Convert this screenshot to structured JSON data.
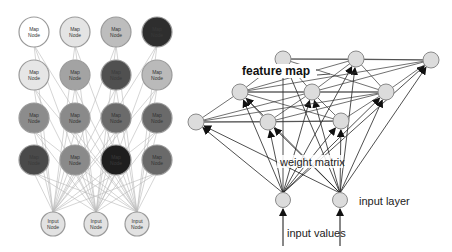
{
  "left_diagram": {
    "map_node_label_line1": "Map",
    "map_node_label_line2": "Node",
    "input_node_label_line1": "Input",
    "input_node_label_line2": "Node",
    "map_nodes": [
      {
        "row": 0,
        "col": 0,
        "fill": "#ffffff"
      },
      {
        "row": 0,
        "col": 1,
        "fill": "#e4e4e4"
      },
      {
        "row": 0,
        "col": 2,
        "fill": "#bdbdbd"
      },
      {
        "row": 0,
        "col": 3,
        "fill": "#2e2e2e"
      },
      {
        "row": 1,
        "col": 0,
        "fill": "#e6e6e6"
      },
      {
        "row": 1,
        "col": 1,
        "fill": "#a3a3a3"
      },
      {
        "row": 1,
        "col": 2,
        "fill": "#505050"
      },
      {
        "row": 1,
        "col": 3,
        "fill": "#bababa"
      },
      {
        "row": 2,
        "col": 0,
        "fill": "#8c8c8c"
      },
      {
        "row": 2,
        "col": 1,
        "fill": "#8a8a8a"
      },
      {
        "row": 2,
        "col": 2,
        "fill": "#6b6b6b"
      },
      {
        "row": 2,
        "col": 3,
        "fill": "#6a6a6a"
      },
      {
        "row": 3,
        "col": 0,
        "fill": "#4a4a4a"
      },
      {
        "row": 3,
        "col": 1,
        "fill": "#8a8a8a"
      },
      {
        "row": 3,
        "col": 2,
        "fill": "#1e1e1e"
      },
      {
        "row": 3,
        "col": 3,
        "fill": "#6a6a6a"
      }
    ],
    "input_nodes": 3
  },
  "right_diagram": {
    "feature_map_label": "feature map",
    "weight_matrix_label": "weight matrix",
    "input_layer_label": "input layer",
    "input_values_label": "input values"
  }
}
